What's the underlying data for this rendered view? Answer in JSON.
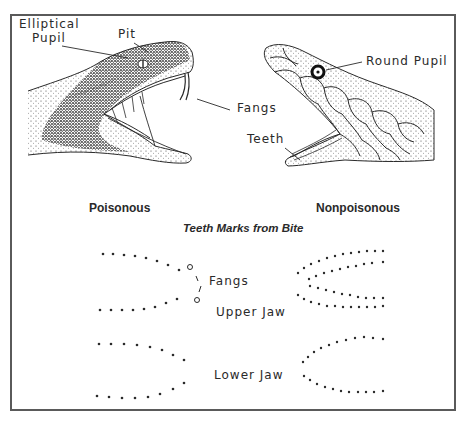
{
  "figure": {
    "poisonous": {
      "heading": "Poisonous",
      "labels": {
        "elliptical_pupil_line1": "Elliptical",
        "elliptical_pupil_line2": "Pupil",
        "pit": "Pit",
        "fangs": "Fangs"
      }
    },
    "nonpoisonous": {
      "heading": "Nonpoisonous",
      "labels": {
        "round_pupil": "Round Pupil",
        "teeth": "Teeth"
      }
    },
    "bite_marks": {
      "title": "Teeth Marks from Bite",
      "fangs_label": "Fangs",
      "upper_jaw_label": "Upper Jaw",
      "lower_jaw_label": "Lower Jaw"
    }
  },
  "colors": {
    "ink": "#2a2a2a",
    "frame": "#5a5a5a",
    "background": "#ffffff"
  }
}
